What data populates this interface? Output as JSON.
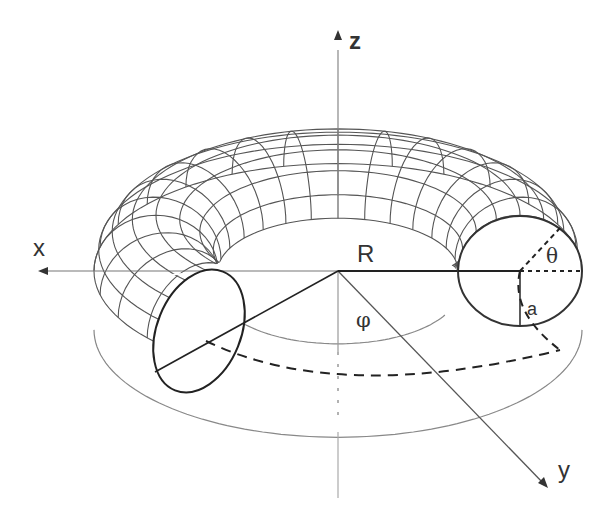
{
  "diagram": {
    "axes": {
      "z": "z",
      "x": "x",
      "y": "y"
    },
    "labels": {
      "major_radius": "R",
      "minor_radius": "a",
      "poloidal_angle": "θ",
      "toroidal_angle": "φ"
    },
    "grid": {
      "toroidal_divisions": 28,
      "poloidal_divisions": 8
    },
    "colors": {
      "line": "#444444",
      "mesh": "#555555",
      "background": "#ffffff"
    }
  }
}
